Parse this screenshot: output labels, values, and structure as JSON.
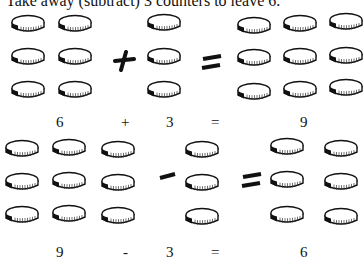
{
  "title": "Take away (subtract) 3 counters to leave 6.",
  "addition": {
    "left_count": 6,
    "right_count": 3,
    "result_count": 9,
    "labels": {
      "left": "6",
      "op": "+",
      "right": "3",
      "eq": "=",
      "result": "9"
    }
  },
  "subtraction": {
    "left_count": 9,
    "right_count": 3,
    "result_count": 6,
    "labels": {
      "left": "9",
      "op": "-",
      "right": "3",
      "eq": "=",
      "result": "6"
    }
  },
  "icons": {
    "counter": "coin-icon",
    "plus": "plus-icon",
    "minus": "minus-icon",
    "equals": "equals-icon"
  }
}
